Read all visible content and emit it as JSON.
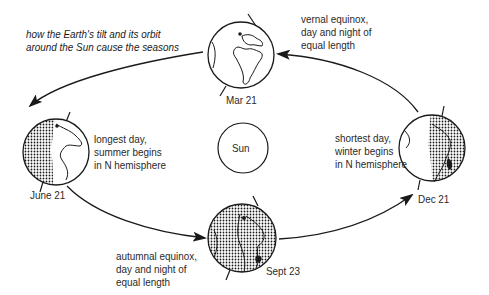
{
  "title": {
    "line1": "how the Earth's tilt and its orbit",
    "line2": "around the Sun cause the seasons"
  },
  "sun": {
    "label": "Sun"
  },
  "positions": [
    {
      "id": "mar21",
      "date": "Mar 21",
      "desc": [
        "vernal equinox,",
        "day and night of",
        "equal length"
      ],
      "shading": "none"
    },
    {
      "id": "june21",
      "date": "June 21",
      "desc": [
        "longest day,",
        "summer begins",
        "in N hemisphere"
      ],
      "shading": "left"
    },
    {
      "id": "sept23",
      "date": "Sept 23",
      "desc": [
        "autumnal equinox,",
        "day and night of",
        "equal length"
      ],
      "shading": "full"
    },
    {
      "id": "dec21",
      "date": "Dec 21",
      "desc": [
        "shortest day,",
        "winter begins",
        "in N hemisphere"
      ],
      "shading": "right"
    }
  ],
  "colors": {
    "line": "#1a1a1a",
    "text": "#2a2a2a",
    "background": "#ffffff"
  }
}
